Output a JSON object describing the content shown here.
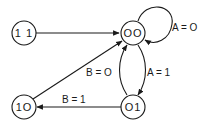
{
  "diagram": {
    "type": "state-transition-diagram",
    "nodes": [
      {
        "id": "11",
        "label": "1 1"
      },
      {
        "id": "00",
        "label": "OO"
      },
      {
        "id": "01",
        "label": "O1"
      },
      {
        "id": "10",
        "label": "1O"
      }
    ],
    "edges": [
      {
        "from": "11",
        "to": "00",
        "label": ""
      },
      {
        "from": "00",
        "to": "00",
        "label": "A = O"
      },
      {
        "from": "00",
        "to": "01",
        "label": "A = 1"
      },
      {
        "from": "01",
        "to": "00",
        "label": "B = O"
      },
      {
        "from": "01",
        "to": "10",
        "label": "B = 1"
      },
      {
        "from": "10",
        "to": "00",
        "label": ""
      }
    ],
    "colors": {
      "stroke": "#1a1a1a",
      "background": "#ffffff"
    }
  }
}
